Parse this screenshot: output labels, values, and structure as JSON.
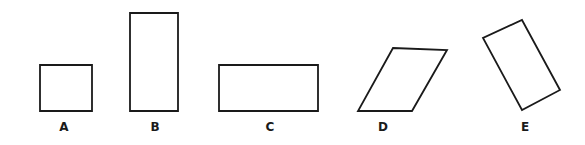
{
  "figure": {
    "stroke_color": "#1a1a1a",
    "background": "#ffffff",
    "shapes": [
      {
        "label": "A",
        "kind": "square",
        "points": "40,65 92,65 92,111 40,111",
        "label_x": 64,
        "label_y": 131
      },
      {
        "label": "B",
        "kind": "tall rectangle",
        "points": "130,13 178,13 178,111 130,111",
        "label_x": 155,
        "label_y": 131
      },
      {
        "label": "C",
        "kind": "wide rectangle",
        "points": "219,65 318,65 318,111 219,111",
        "label_x": 270,
        "label_y": 131
      },
      {
        "label": "D",
        "kind": "parallelogram",
        "points": "393,48 447,50 412,111 358,111",
        "label_x": 383,
        "label_y": 131
      },
      {
        "label": "E",
        "kind": "rotated rectangle",
        "points": "522,20 560,90 522,110 483,38",
        "label_x": 525,
        "label_y": 131
      }
    ]
  }
}
